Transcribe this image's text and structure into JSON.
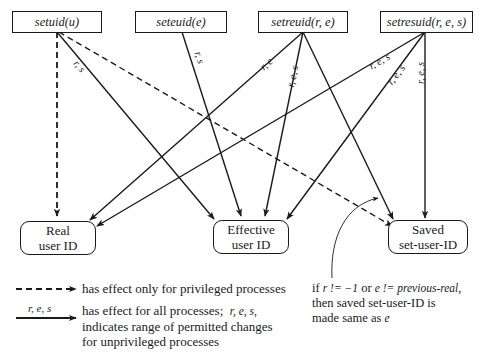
{
  "diagram": {
    "title": "",
    "sources": [
      {
        "id": "setuid",
        "label": "setuid(u)"
      },
      {
        "id": "seteuid",
        "label": "seteuid(e)"
      },
      {
        "id": "setreuid",
        "label": "setreuid(r, e)"
      },
      {
        "id": "setresuid",
        "label": "setresuid(r, e, s)"
      }
    ],
    "targets": [
      {
        "id": "real",
        "line1": "Real",
        "line2": "user ID"
      },
      {
        "id": "effective",
        "line1": "Effective",
        "line2": "user ID"
      },
      {
        "id": "saved",
        "line1": "Saved",
        "line2": "set-user-ID"
      }
    ],
    "edges": [
      {
        "from": "setuid",
        "to": "real",
        "style": "dashed",
        "label": ""
      },
      {
        "from": "setuid",
        "to": "effective",
        "style": "solid",
        "label": "r, s"
      },
      {
        "from": "setuid",
        "to": "saved",
        "style": "dashed",
        "label": ""
      },
      {
        "from": "seteuid",
        "to": "effective",
        "style": "solid",
        "label": "r, s"
      },
      {
        "from": "setreuid",
        "to": "real",
        "style": "solid",
        "label": "r, e"
      },
      {
        "from": "setreuid",
        "to": "effective",
        "style": "solid",
        "label": "r, e, s"
      },
      {
        "from": "setreuid",
        "to": "saved",
        "style": "solid",
        "label": ""
      },
      {
        "from": "setresuid",
        "to": "real",
        "style": "solid",
        "label": "r, e, s"
      },
      {
        "from": "setresuid",
        "to": "effective",
        "style": "solid",
        "label": "r, e, s"
      },
      {
        "from": "setresuid",
        "to": "saved",
        "style": "solid",
        "label": "r, e, s"
      }
    ],
    "edge_labels": {
      "setuid_eff": "r, s",
      "seteuid_eff": "r, s",
      "setreuid_real": "r, e",
      "setreuid_eff": "r, e, s",
      "setresuid_real": "r, e, s",
      "setresuid_eff": "r, e, s",
      "setresuid_saved": "r, e, s"
    },
    "legend": {
      "dashed_text": "has effect only for privileged processes",
      "solid_arrow_label": "r, e, s",
      "solid_text_1": "has effect for all processes;",
      "solid_text_1_italic": "r, e, s,",
      "solid_text_2": "indicates range of permitted changes",
      "solid_text_3": "for unprivileged processes"
    },
    "note": {
      "prefix_if": "if",
      "cond1": "r != −1",
      "or": "or",
      "cond2": "e != previous-real",
      "comma": ",",
      "line2": "then saved set-user-ID is",
      "line3_text": "made same as",
      "line3_italic": "e"
    },
    "colors": {
      "stroke": "#1a1a1a",
      "background": "#ffffff"
    }
  }
}
